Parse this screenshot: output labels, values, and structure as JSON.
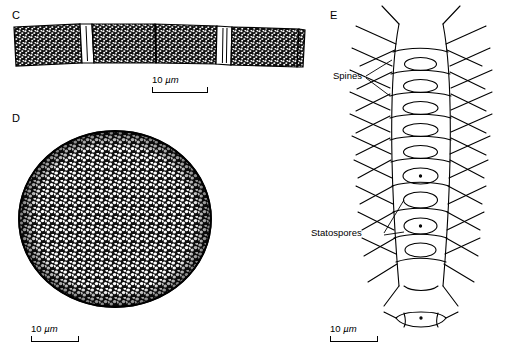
{
  "figure": {
    "panels": [
      {
        "id": "C",
        "letter": "C"
      },
      {
        "id": "D",
        "letter": "D"
      },
      {
        "id": "E",
        "letter": "E"
      }
    ],
    "scalebars": [
      {
        "id": "c-scale",
        "value": "10",
        "unit": "µm"
      },
      {
        "id": "d-scale",
        "value": "10",
        "unit": "µm"
      },
      {
        "id": "e-scale",
        "value": "10",
        "unit": "µm"
      }
    ],
    "callouts": [
      {
        "id": "spines",
        "label": "Spines"
      },
      {
        "id": "statospores",
        "label": "Statospores"
      }
    ]
  }
}
